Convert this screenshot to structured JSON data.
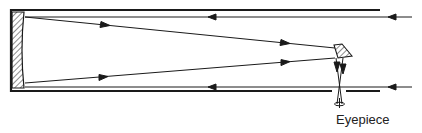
{
  "diagram": {
    "type": "newtonian-telescope-ray-diagram",
    "labels": {
      "eyepiece": "Eyepiece"
    },
    "components": [
      "tube",
      "primary-mirror",
      "secondary-mirror",
      "eyepiece",
      "incoming-rays",
      "reflected-rays"
    ],
    "colors": {
      "stroke": "#1a1a1a",
      "background": "#ffffff"
    }
  }
}
